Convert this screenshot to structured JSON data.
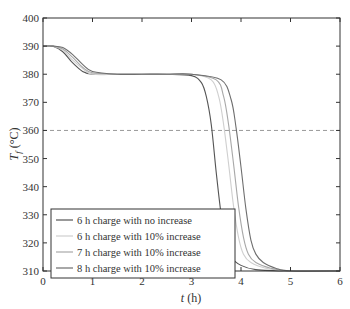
{
  "chart_data": {
    "type": "line",
    "title": "",
    "xlabel": "t (h)",
    "ylabel": "T_f (°C)",
    "xlim": [
      0,
      6
    ],
    "ylim": [
      310,
      400
    ],
    "xticks": [
      0,
      1,
      2,
      3,
      4,
      5,
      6
    ],
    "yticks": [
      310,
      320,
      330,
      340,
      350,
      360,
      370,
      380,
      390,
      400
    ],
    "grid": false,
    "legend_position": "lower left",
    "reference_line": {
      "y": 360,
      "style": "dashed",
      "color": "#9a9a9a"
    },
    "series": [
      {
        "name": "6 h charge with no increase",
        "color": "#555555",
        "x": [
          0,
          0.2,
          0.4,
          0.6,
          0.8,
          1.0,
          1.5,
          2.0,
          2.5,
          3.0,
          3.2,
          3.3,
          3.4,
          3.5,
          3.6,
          3.7,
          3.8,
          4.0,
          4.3,
          5.0,
          6.0
        ],
        "y": [
          390,
          390,
          388,
          384,
          381,
          380,
          380,
          380,
          380,
          379.5,
          377,
          372,
          362,
          345,
          330,
          320,
          315,
          312,
          310.5,
          310,
          310
        ]
      },
      {
        "name": "6 h charge with 10% increase",
        "color": "#cfcfcf",
        "x": [
          0,
          0.2,
          0.4,
          0.6,
          0.8,
          1.0,
          1.5,
          2.0,
          2.5,
          3.0,
          3.4,
          3.55,
          3.65,
          3.75,
          3.85,
          3.95,
          4.05,
          4.2,
          4.5,
          5.0,
          6.0
        ],
        "y": [
          390,
          390,
          388.5,
          385,
          382,
          380,
          380,
          380,
          380,
          380,
          378,
          372,
          362,
          348,
          333,
          322,
          316,
          313,
          311,
          310,
          310
        ]
      },
      {
        "name": "7 h charge with 10% increase",
        "color": "#a8a8a8",
        "x": [
          0,
          0.2,
          0.4,
          0.6,
          0.8,
          1.0,
          1.5,
          2.0,
          2.5,
          3.0,
          3.5,
          3.65,
          3.75,
          3.85,
          3.95,
          4.05,
          4.15,
          4.3,
          4.6,
          5.0,
          6.0
        ],
        "y": [
          390,
          390,
          389,
          386,
          382.5,
          380.5,
          380,
          380,
          380,
          380,
          378,
          372,
          362,
          348,
          333,
          322,
          316,
          313,
          311,
          310,
          310
        ]
      },
      {
        "name": "8 h charge with 10% increase",
        "color": "#6e6e6e",
        "x": [
          0,
          0.2,
          0.4,
          0.6,
          0.8,
          1.0,
          1.5,
          2.0,
          2.5,
          3.0,
          3.6,
          3.8,
          3.9,
          4.0,
          4.1,
          4.2,
          4.3,
          4.45,
          4.7,
          5.0,
          6.0
        ],
        "y": [
          390,
          390,
          389.5,
          387,
          383.5,
          381,
          380,
          380,
          380,
          380,
          378,
          371,
          361,
          347,
          332,
          321,
          316,
          313,
          311,
          310,
          310
        ]
      }
    ]
  }
}
